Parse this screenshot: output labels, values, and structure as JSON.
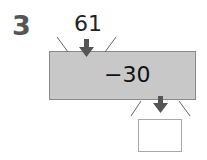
{
  "question_number": "3",
  "input_value": "61",
  "operation": "−30",
  "output_value": "",
  "colors": {
    "machine_fill": "#c8c8c8",
    "arrow": "#555555"
  }
}
